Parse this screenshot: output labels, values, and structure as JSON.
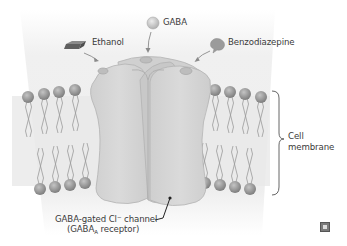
{
  "diagram": {
    "labels": {
      "gaba": "GABA",
      "ethanol": "Ethanol",
      "benzodiazepine": "Benzodiazepine",
      "cell_membrane_line1": "Cell",
      "cell_membrane_line2": "membrane",
      "channel_line1_pre": "GABA-gated Cl",
      "channel_line1_sup": "−",
      "channel_line1_post": " channel",
      "channel_line2_pre": "(GABA",
      "channel_line2_sub": "A",
      "channel_line2_post": " receptor)"
    },
    "colors": {
      "background_glow": "#ececec",
      "receptor_fill": "#d2d2d2",
      "receptor_stroke": "#b5b5b5",
      "phospholipid_head": "#8e8e8e",
      "tail": "#9a9a9a",
      "ethanol_block": "#6e6e6e",
      "benzodiazepine_blob": "#9b9b9b",
      "gaba_ball": "#c9c9c9",
      "text": "#3a3a3a"
    },
    "icons": [
      "gaba-molecule-icon",
      "ethanol-molecule-icon",
      "benzodiazepine-molecule-icon",
      "publisher-logo-icon"
    ]
  }
}
